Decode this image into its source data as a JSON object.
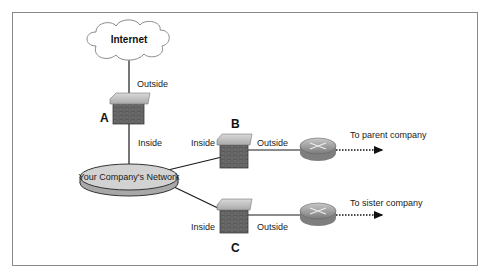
{
  "diagram": {
    "frame": {
      "x": 12,
      "y": 12,
      "width": 466,
      "height": 254,
      "stroke": "#8a8a8a"
    },
    "internet": {
      "label": "Internet"
    },
    "network": {
      "label": "Your Company's Network"
    },
    "firewalls": {
      "a": {
        "letter": "A",
        "outside_label": "Outside",
        "inside_label": "Inside"
      },
      "b": {
        "letter": "B",
        "inside_label": "Inside",
        "outside_label": "Outside"
      },
      "c": {
        "letter": "C",
        "inside_label": "Inside",
        "outside_label": "Outside"
      }
    },
    "routers": {
      "b": {
        "destination": "To parent company"
      },
      "c": {
        "destination": "To sister company"
      }
    },
    "colors": {
      "cap": "#c7c7c7",
      "brick": "#5f5f5f",
      "brick_dark": "#454545",
      "disk_top": "#d2d2d2",
      "disk_side": "#a8a8a8",
      "router": "#9a9a9a",
      "line": "#1a1a1a"
    }
  }
}
